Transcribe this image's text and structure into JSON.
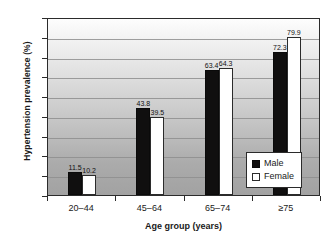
{
  "chart_data": {
    "type": "bar",
    "title": "",
    "subtitle": "",
    "xlabel": "Age group (years)",
    "ylabel": "Hypertension prevalence (%)",
    "categories": [
      "20–44",
      "45–64",
      "65–74",
      "≥75"
    ],
    "series": [
      {
        "name": "Male",
        "color": "#100f0f",
        "values": [
          11.5,
          43.8,
          63.4,
          72.3
        ],
        "labels": [
          "11.5",
          "43.8",
          "63.4",
          "72.3"
        ]
      },
      {
        "name": "Female",
        "color": "#ffffff",
        "values": [
          10.2,
          39.5,
          64.3,
          79.9
        ],
        "labels": [
          "10.2",
          "39.5",
          "64.3",
          "79.9"
        ]
      }
    ],
    "ylim": [
      0,
      90
    ],
    "ytick_values": [
      90,
      80,
      70,
      60,
      50,
      40,
      30,
      20,
      10,
      0
    ],
    "ytick_labels": [
      "90",
      "80",
      "70",
      "60",
      "50",
      "40",
      "30",
      "20",
      "10",
      "0"
    ],
    "grid": true,
    "grid_axis": "y",
    "legend_position": "bottom-right",
    "plot_background": "vertical-gradient-light-to-gray",
    "bar_value_labels": true
  },
  "legend": {
    "items": [
      {
        "label": "Male",
        "swatch": "filled-black-square"
      },
      {
        "label": "Female",
        "swatch": "open-white-square"
      }
    ]
  }
}
